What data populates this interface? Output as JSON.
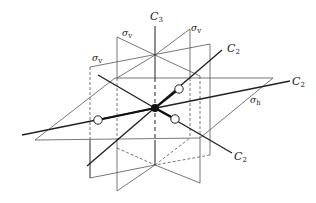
{
  "figure": {
    "colors": {
      "plane_line": "#555555",
      "axis_line": "#222222",
      "center_atom": "#111111",
      "outer_atom_fill": "#ffffff",
      "background": "#ffffff"
    },
    "labels": {
      "c3": {
        "main": "C",
        "sub": "3"
      },
      "c2_upper_right": {
        "main": "C",
        "sub": "2"
      },
      "c2_right": {
        "main": "C",
        "sub": "2"
      },
      "c2_lower_right": {
        "main": "C",
        "sub": "2"
      },
      "sigma_v_top_left": {
        "main": "σ",
        "sub": "v"
      },
      "sigma_v_top_right": {
        "main": "σ",
        "sub": "v"
      },
      "sigma_v_left": {
        "main": "σ",
        "sub": "v"
      },
      "sigma_h": {
        "main": "σ",
        "sub": "h"
      }
    },
    "elements": {
      "axes": [
        "C3 principal axis (vertical)",
        "C2 axis",
        "C2 axis",
        "C2 axis"
      ],
      "planes": [
        "σv",
        "σv",
        "σv",
        "σh"
      ],
      "atoms": {
        "central": 1,
        "peripheral": 3
      }
    }
  }
}
